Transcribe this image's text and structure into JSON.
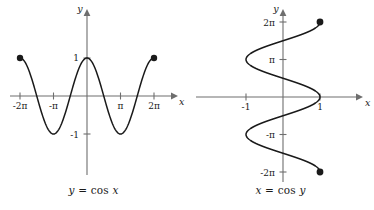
{
  "figure": {
    "background_color": "#ffffff",
    "curve_color": "#1a1a1a",
    "axis_color": "#6e6e6e"
  },
  "panels": [
    {
      "id": "left",
      "caption": "y = cos x",
      "caption_lhs": "y",
      "caption_op": "=",
      "caption_fn": "cos",
      "caption_arg": "x",
      "x_axis_name": "x",
      "y_axis_name": "y",
      "x_tick_labels": [
        "-2π",
        "-π",
        "π",
        "2π"
      ],
      "y_tick_labels": [
        "1",
        "-1"
      ],
      "endpoint_labels": [
        "(-2π, 1)",
        "(2π, 1)"
      ]
    },
    {
      "id": "right",
      "caption": "x = cos y",
      "caption_lhs": "x",
      "caption_op": "=",
      "caption_fn": "cos",
      "caption_arg": "y",
      "x_axis_name": "x",
      "y_axis_name": "y",
      "x_tick_labels": [
        "-1",
        "1"
      ],
      "y_tick_labels": [
        "2π",
        "π",
        "-π",
        "-2π"
      ],
      "endpoint_labels": [
        "(1, 2π)",
        "(1, -2π)"
      ]
    }
  ],
  "chart_data": [
    {
      "type": "line",
      "title": "y = cos x",
      "xlabel": "x",
      "ylabel": "y",
      "xlim": [
        -7.5398,
        7.5398
      ],
      "ylim": [
        -1.6,
        1.6
      ],
      "grid": false,
      "legend": "none",
      "function": "y = cos(x)",
      "domain": [
        -6.2832,
        6.2832
      ],
      "range": [
        -1,
        1
      ],
      "xticks": [
        -6.2832,
        -3.1416,
        3.1416,
        6.2832
      ],
      "xticklabels": [
        "-2π",
        "-π",
        "π",
        "2π"
      ],
      "yticks": [
        1,
        -1
      ],
      "yticklabels": [
        "1",
        "-1"
      ],
      "endpoints": [
        {
          "x": -6.2832,
          "y": 1,
          "marker": "filled-circle"
        },
        {
          "x": 6.2832,
          "y": 1,
          "marker": "filled-circle"
        }
      ],
      "x": [
        -6.2832,
        -5.4978,
        -4.7124,
        -3.927,
        -3.1416,
        -2.3562,
        -1.5708,
        -0.7854,
        0,
        0.7854,
        1.5708,
        2.3562,
        3.1416,
        3.927,
        4.7124,
        5.4978,
        6.2832
      ],
      "values": [
        1,
        0.7071,
        0,
        -0.7071,
        -1,
        -0.7071,
        0,
        0.7071,
        1,
        0.7071,
        0,
        -0.7071,
        -1,
        -0.7071,
        0,
        0.7071,
        1
      ]
    },
    {
      "type": "line",
      "title": "x = cos y",
      "xlabel": "x",
      "ylabel": "y",
      "xlim": [
        -2.1,
        2.1
      ],
      "ylim": [
        -7.5398,
        7.5398
      ],
      "grid": false,
      "legend": "none",
      "function": "x = cos(y)",
      "domain": [
        -6.2832,
        6.2832
      ],
      "range": [
        -1,
        1
      ],
      "xticks": [
        -1,
        1
      ],
      "xticklabels": [
        "-1",
        "1"
      ],
      "yticks": [
        6.2832,
        3.1416,
        -3.1416,
        -6.2832
      ],
      "yticklabels": [
        "2π",
        "π",
        "-π",
        "-2π"
      ],
      "endpoints": [
        {
          "x": 1,
          "y": 6.2832,
          "marker": "filled-circle"
        },
        {
          "x": 1,
          "y": -6.2832,
          "marker": "filled-circle"
        }
      ],
      "y": [
        -6.2832,
        -5.4978,
        -4.7124,
        -3.927,
        -3.1416,
        -2.3562,
        -1.5708,
        -0.7854,
        0,
        0.7854,
        1.5708,
        2.3562,
        3.1416,
        3.927,
        4.7124,
        5.4978,
        6.2832
      ],
      "values": [
        1,
        0.7071,
        0,
        -0.7071,
        -1,
        -0.7071,
        0,
        0.7071,
        1,
        0.7071,
        0,
        -0.7071,
        -1,
        -0.7071,
        0,
        0.7071,
        1
      ]
    }
  ]
}
